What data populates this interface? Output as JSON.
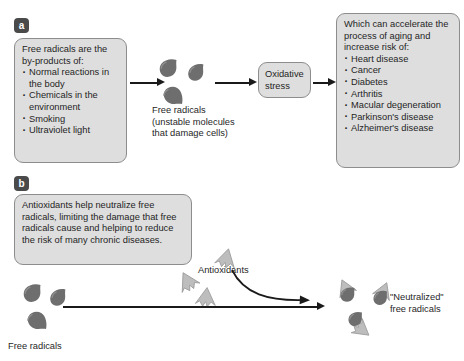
{
  "figure": {
    "colors": {
      "box_fill": "#dedede",
      "box_border": "#8d8d8d",
      "radical_dark": "#6e6e6e",
      "antioxidant_light": "#bdbdbd",
      "arrow": "#1a1a1a",
      "badge": "#4a4a4a",
      "text": "#1f1f1f"
    }
  },
  "panel_a": {
    "label": "a",
    "sources_box": {
      "lead": "Free radicals are the by-products of:",
      "items": [
        "Normal reactions in the body",
        "Chemicals in the environment",
        "Smoking",
        "Ultraviolet light"
      ]
    },
    "free_radicals_caption": "Free radicals\n(unstable molecules\nthat damage cells)",
    "oxidative_stress": "Oxidative stress",
    "risks_box": {
      "lead": "Which can accelerate the process of aging and increase risk of:",
      "items": [
        "Heart disease",
        "Cancer",
        "Diabetes",
        "Arthritis",
        "Macular degeneration",
        "Parkinson's disease",
        "Alzheimer's disease"
      ]
    }
  },
  "panel_b": {
    "label": "b",
    "antioxidant_box": "Antioxidants help neutralize free radicals, limiting the damage that free radicals cause and helping to reduce the risk of many chronic diseases.",
    "free_radicals_caption": "Free radicals",
    "antioxidants_caption": "Antioxidants",
    "neutralized_caption": "\"Neutralized\"\nfree radicals"
  }
}
